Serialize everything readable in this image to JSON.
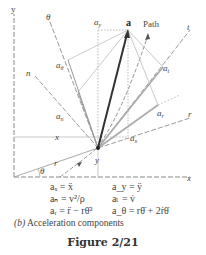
{
  "diagram": {
    "axes": {
      "x_label": "x",
      "y_label": "y"
    },
    "point_labels": {
      "acceleration_vector": "a",
      "path": "Path"
    },
    "axis_labels": {
      "theta": "θ",
      "n": "n",
      "t": "t",
      "r": "r"
    },
    "component_labels": {
      "a_y": "a",
      "a_y_sub": "y",
      "a_theta": "a",
      "a_theta_sub": "θ",
      "a_n": "a",
      "a_n_sub": "n",
      "a_t": "a",
      "a_t_sub": "t",
      "a_r": "a",
      "a_r_sub": "r",
      "a_x": "a",
      "a_x_sub": "x"
    },
    "dimension_labels": {
      "x": "x",
      "y": "y",
      "r": "r",
      "theta": "θ"
    },
    "colors": {
      "vector": "#333333",
      "axis": "#888888",
      "component": "#aaaaaa"
    }
  },
  "equations": {
    "row1_left": "aₓ = ẍ",
    "row1_right": "a_y = ÿ",
    "row2_left": "aₙ = v²/ρ",
    "row2_right": "aₜ = v̇",
    "row3_left": "aᵣ = r̈ − rθ̇²",
    "row3_right": "a_θ = rθ̈ + 2ṙθ̇"
  },
  "caption": {
    "label": "(b)",
    "text": " Acceleration components"
  },
  "figure_title": "Figure 2/21"
}
